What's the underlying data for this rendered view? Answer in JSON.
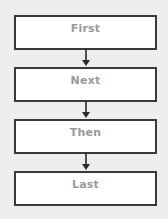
{
  "diagram": {
    "type": "flowchart",
    "direction": "top-to-bottom",
    "steps": [
      {
        "label": "First"
      },
      {
        "label": "Next"
      },
      {
        "label": "Then"
      },
      {
        "label": "Last"
      }
    ],
    "connectors": [
      {
        "from": 0,
        "to": 1,
        "icon": "arrow-down-icon"
      },
      {
        "from": 1,
        "to": 2,
        "icon": "arrow-down-icon"
      },
      {
        "from": 2,
        "to": 3,
        "icon": "arrow-down-icon"
      }
    ],
    "colors": {
      "background": "#eeeeec",
      "box_fill": "#ffffff",
      "box_border": "#3a3a3a",
      "text": "#9a9a9a",
      "arrow": "#2a2a2a"
    }
  }
}
